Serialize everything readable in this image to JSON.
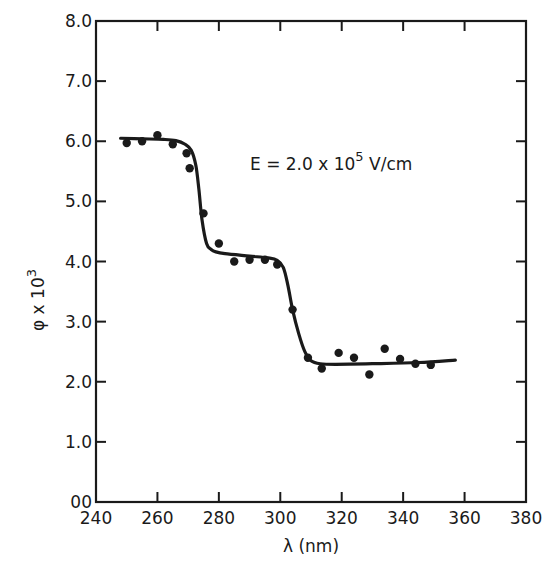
{
  "chart_data": {
    "type": "scatter",
    "title": "",
    "xlabel": "λ (nm)",
    "ylabel": "φ x 10^3",
    "ylabel_base": "φ x 10",
    "ylabel_exp": "3",
    "xlim": [
      240,
      380
    ],
    "ylim": [
      0,
      8.0
    ],
    "x_ticks": [
      240,
      260,
      280,
      300,
      320,
      340,
      360,
      380
    ],
    "x_tick_labels": [
      "240",
      "260",
      "280",
      "300",
      "320",
      "340",
      "360",
      "380"
    ],
    "y_ticks": [
      0,
      1.0,
      2.0,
      3.0,
      4.0,
      5.0,
      6.0,
      7.0,
      8.0
    ],
    "y_tick_labels": [
      "00",
      "1.0",
      "2.0",
      "3.0",
      "4.0",
      "5.0",
      "6.0",
      "7.0",
      "8.0"
    ],
    "grid": false,
    "legend": null,
    "annotation": {
      "text_base": "E = 2.0 x 10",
      "text_exp": "5",
      "text_unit": " V/cm",
      "full_text": "E = 2.0 x 10^5 V/cm",
      "x": 302,
      "y": 6.2
    },
    "series": [
      {
        "name": "measured",
        "style": "points",
        "color": "#1a1a1a",
        "x": [
          250,
          255,
          260,
          265,
          269.5,
          270.5,
          275,
          280,
          285,
          290,
          295,
          299,
          304,
          309,
          313.5,
          319,
          324,
          329,
          334,
          339,
          344,
          349
        ],
        "y": [
          5.97,
          6.0,
          6.1,
          5.95,
          5.8,
          5.55,
          4.8,
          4.3,
          4.0,
          4.03,
          4.03,
          3.95,
          3.2,
          2.4,
          2.22,
          2.48,
          2.4,
          2.12,
          2.55,
          2.38,
          2.3,
          2.28
        ]
      },
      {
        "name": "fit",
        "style": "line",
        "color": "#1a1a1a",
        "x": [
          248,
          255,
          262,
          266,
          269,
          271,
          272.5,
          273.5,
          274.5,
          276,
          277.5,
          279,
          282,
          290,
          296,
          299,
          301,
          302.5,
          304,
          306,
          308,
          310,
          313,
          318,
          330,
          345,
          357
        ],
        "y": [
          6.05,
          6.04,
          6.03,
          6.01,
          5.95,
          5.85,
          5.6,
          5.2,
          4.7,
          4.3,
          4.2,
          4.16,
          4.13,
          4.09,
          4.06,
          4.02,
          3.9,
          3.6,
          3.2,
          2.8,
          2.5,
          2.35,
          2.3,
          2.29,
          2.3,
          2.32,
          2.36
        ]
      }
    ]
  }
}
